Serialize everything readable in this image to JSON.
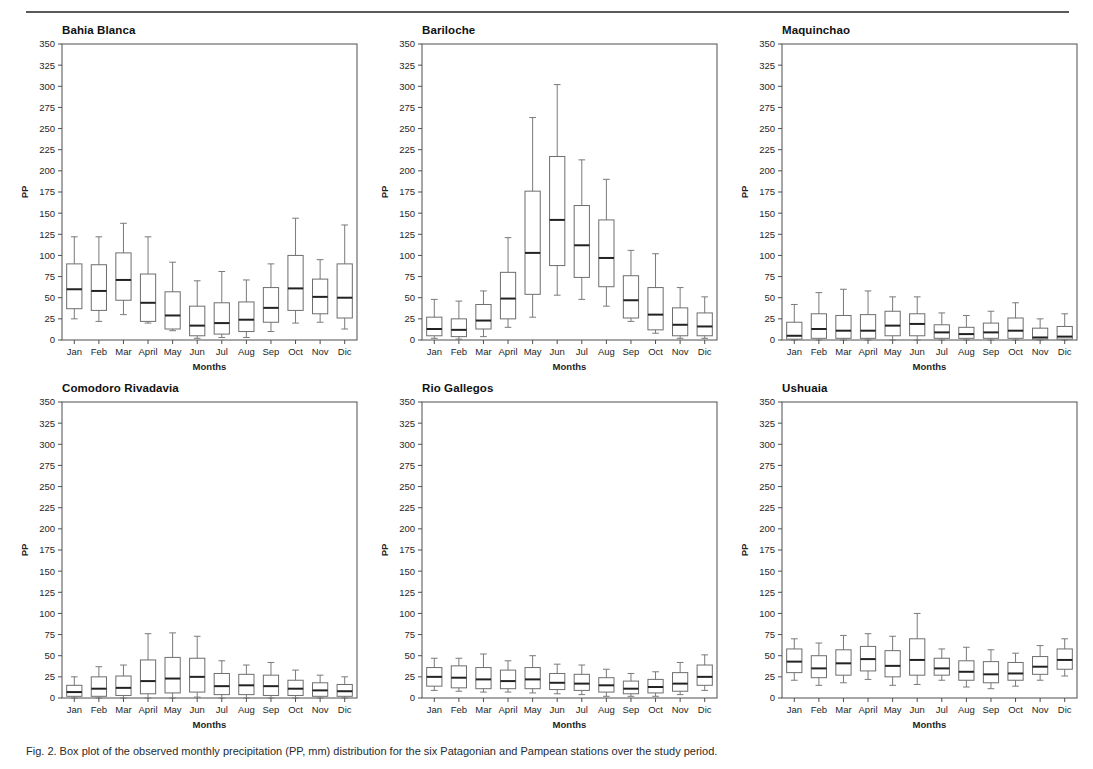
{
  "figure": {
    "caption": "Fig. 2. Box plot of the observed monthly precipitation (PP, mm) distribution for the six Patagonian and Pampean stations over the study period.",
    "axis_x_title": "Months",
    "axis_y_title": "PP",
    "months": [
      "Jan",
      "Feb",
      "Mar",
      "April",
      "May",
      "Jun",
      "Jul",
      "Aug",
      "Sep",
      "Oct",
      "Nov",
      "Dic"
    ],
    "y_ticks": [
      0,
      25,
      50,
      75,
      100,
      125,
      150,
      175,
      200,
      225,
      250,
      275,
      300,
      325,
      350
    ],
    "colors": {
      "axis": "#4f4f4f",
      "box": "#6e6e6e",
      "median": "#222222",
      "whisker": "#7a7a7a",
      "rule": "#5a5a5a",
      "background": "#ffffff"
    }
  },
  "chart_data": [
    {
      "type": "box",
      "title": "Bahia Blanca",
      "xlabel": "Months",
      "ylabel": "PP",
      "ylim": [
        0,
        350
      ],
      "categories": [
        "Jan",
        "Feb",
        "Mar",
        "April",
        "May",
        "Jun",
        "Jul",
        "Aug",
        "Sep",
        "Oct",
        "Nov",
        "Dic"
      ],
      "boxes": [
        {
          "category": "Jan",
          "min": 25,
          "q1": 37,
          "median": 60,
          "q3": 90,
          "max": 122
        },
        {
          "category": "Feb",
          "min": 22,
          "q1": 35,
          "median": 58,
          "q3": 89,
          "max": 122
        },
        {
          "category": "Mar",
          "min": 30,
          "q1": 47,
          "median": 71,
          "q3": 103,
          "max": 138
        },
        {
          "category": "April",
          "min": 20,
          "q1": 22,
          "median": 44,
          "q3": 78,
          "max": 122
        },
        {
          "category": "May",
          "min": 11,
          "q1": 13,
          "median": 29,
          "q3": 57,
          "max": 92
        },
        {
          "category": "Jun",
          "min": 2,
          "q1": 5,
          "median": 17,
          "q3": 40,
          "max": 70
        },
        {
          "category": "Jul",
          "min": 3,
          "q1": 7,
          "median": 20,
          "q3": 44,
          "max": 81
        },
        {
          "category": "Aug",
          "min": 3,
          "q1": 10,
          "median": 24,
          "q3": 45,
          "max": 71
        },
        {
          "category": "Sep",
          "min": 10,
          "q1": 21,
          "median": 38,
          "q3": 62,
          "max": 90
        },
        {
          "category": "Oct",
          "min": 20,
          "q1": 35,
          "median": 61,
          "q3": 100,
          "max": 144
        },
        {
          "category": "Nov",
          "min": 21,
          "q1": 31,
          "median": 51,
          "q3": 72,
          "max": 95
        },
        {
          "category": "Dic",
          "min": 13,
          "q1": 26,
          "median": 50,
          "q3": 90,
          "max": 136
        }
      ]
    },
    {
      "type": "box",
      "title": "Bariloche",
      "xlabel": "Months",
      "ylabel": "PP",
      "ylim": [
        0,
        350
      ],
      "categories": [
        "Jan",
        "Feb",
        "Mar",
        "April",
        "May",
        "Jun",
        "Jul",
        "Aug",
        "Sep",
        "Oct",
        "Nov",
        "Dic"
      ],
      "boxes": [
        {
          "category": "Jan",
          "min": 2,
          "q1": 5,
          "median": 13,
          "q3": 27,
          "max": 48
        },
        {
          "category": "Feb",
          "min": 1,
          "q1": 4,
          "median": 12,
          "q3": 25,
          "max": 46
        },
        {
          "category": "Mar",
          "min": 4,
          "q1": 13,
          "median": 23,
          "q3": 42,
          "max": 58
        },
        {
          "category": "April",
          "min": 15,
          "q1": 25,
          "median": 49,
          "q3": 80,
          "max": 121
        },
        {
          "category": "May",
          "min": 27,
          "q1": 54,
          "median": 103,
          "q3": 176,
          "max": 263
        },
        {
          "category": "Jun",
          "min": 53,
          "q1": 88,
          "median": 142,
          "q3": 217,
          "max": 302
        },
        {
          "category": "Jul",
          "min": 48,
          "q1": 74,
          "median": 112,
          "q3": 159,
          "max": 213
        },
        {
          "category": "Aug",
          "min": 40,
          "q1": 63,
          "median": 97,
          "q3": 142,
          "max": 190
        },
        {
          "category": "Sep",
          "min": 22,
          "q1": 26,
          "median": 47,
          "q3": 76,
          "max": 106
        },
        {
          "category": "Oct",
          "min": 8,
          "q1": 12,
          "median": 30,
          "q3": 62,
          "max": 102
        },
        {
          "category": "Nov",
          "min": 2,
          "q1": 5,
          "median": 18,
          "q3": 38,
          "max": 62
        },
        {
          "category": "Dic",
          "min": 2,
          "q1": 5,
          "median": 16,
          "q3": 32,
          "max": 51
        }
      ]
    },
    {
      "type": "box",
      "title": "Maquinchao",
      "xlabel": "Months",
      "ylabel": "PP",
      "ylim": [
        0,
        350
      ],
      "categories": [
        "Jan",
        "Feb",
        "Mar",
        "April",
        "May",
        "Jun",
        "Jul",
        "Aug",
        "Sep",
        "Oct",
        "Nov",
        "Dic"
      ],
      "boxes": [
        {
          "category": "Jan",
          "min": 0,
          "q1": 1,
          "median": 5,
          "q3": 21,
          "max": 42
        },
        {
          "category": "Feb",
          "min": 0,
          "q1": 2,
          "median": 13,
          "q3": 31,
          "max": 56
        },
        {
          "category": "Mar",
          "min": 0,
          "q1": 2,
          "median": 11,
          "q3": 29,
          "max": 60
        },
        {
          "category": "April",
          "min": 0,
          "q1": 2,
          "median": 11,
          "q3": 30,
          "max": 58
        },
        {
          "category": "May",
          "min": 0,
          "q1": 5,
          "median": 17,
          "q3": 34,
          "max": 51
        },
        {
          "category": "Jun",
          "min": 0,
          "q1": 5,
          "median": 19,
          "q3": 31,
          "max": 51
        },
        {
          "category": "Jul",
          "min": 0,
          "q1": 2,
          "median": 9,
          "q3": 18,
          "max": 32
        },
        {
          "category": "Aug",
          "min": 0,
          "q1": 2,
          "median": 7,
          "q3": 15,
          "max": 29
        },
        {
          "category": "Sep",
          "min": 0,
          "q1": 2,
          "median": 9,
          "q3": 20,
          "max": 34
        },
        {
          "category": "Oct",
          "min": 0,
          "q1": 2,
          "median": 11,
          "q3": 26,
          "max": 44
        },
        {
          "category": "Nov",
          "min": 0,
          "q1": 1,
          "median": 3,
          "q3": 14,
          "max": 25
        },
        {
          "category": "Dic",
          "min": 0,
          "q1": 1,
          "median": 4,
          "q3": 16,
          "max": 31
        }
      ]
    },
    {
      "type": "box",
      "title": "Comodoro Rivadavia",
      "xlabel": "Months",
      "ylabel": "PP",
      "ylim": [
        0,
        350
      ],
      "categories": [
        "Jan",
        "Feb",
        "Mar",
        "April",
        "May",
        "Jun",
        "Jul",
        "Aug",
        "Sep",
        "Oct",
        "Nov",
        "Dic"
      ],
      "boxes": [
        {
          "category": "Jan",
          "min": 0,
          "q1": 2,
          "median": 7,
          "q3": 15,
          "max": 25
        },
        {
          "category": "Feb",
          "min": 0,
          "q1": 2,
          "median": 11,
          "q3": 25,
          "max": 37
        },
        {
          "category": "Mar",
          "min": 0,
          "q1": 3,
          "median": 12,
          "q3": 26,
          "max": 39
        },
        {
          "category": "April",
          "min": 0,
          "q1": 5,
          "median": 20,
          "q3": 45,
          "max": 76
        },
        {
          "category": "May",
          "min": 0,
          "q1": 6,
          "median": 23,
          "q3": 48,
          "max": 77
        },
        {
          "category": "Jun",
          "min": 1,
          "q1": 7,
          "median": 25,
          "q3": 47,
          "max": 73
        },
        {
          "category": "Jul",
          "min": 0,
          "q1": 4,
          "median": 14,
          "q3": 29,
          "max": 44
        },
        {
          "category": "Aug",
          "min": 0,
          "q1": 4,
          "median": 15,
          "q3": 28,
          "max": 39
        },
        {
          "category": "Sep",
          "min": 0,
          "q1": 3,
          "median": 14,
          "q3": 27,
          "max": 42
        },
        {
          "category": "Oct",
          "min": 0,
          "q1": 3,
          "median": 11,
          "q3": 21,
          "max": 33
        },
        {
          "category": "Nov",
          "min": 0,
          "q1": 2,
          "median": 9,
          "q3": 18,
          "max": 27
        },
        {
          "category": "Dic",
          "min": 0,
          "q1": 2,
          "median": 8,
          "q3": 16,
          "max": 25
        }
      ]
    },
    {
      "type": "box",
      "title": "Rio Gallegos",
      "xlabel": "Months",
      "ylabel": "PP",
      "ylim": [
        0,
        350
      ],
      "categories": [
        "Jan",
        "Feb",
        "Mar",
        "April",
        "May",
        "Jun",
        "Jul",
        "Aug",
        "Sep",
        "Oct",
        "Nov",
        "Dic"
      ],
      "boxes": [
        {
          "category": "Jan",
          "min": 9,
          "q1": 14,
          "median": 25,
          "q3": 36,
          "max": 47
        },
        {
          "category": "Feb",
          "min": 8,
          "q1": 12,
          "median": 24,
          "q3": 38,
          "max": 47
        },
        {
          "category": "Mar",
          "min": 7,
          "q1": 11,
          "median": 22,
          "q3": 36,
          "max": 52
        },
        {
          "category": "April",
          "min": 7,
          "q1": 11,
          "median": 20,
          "q3": 33,
          "max": 44
        },
        {
          "category": "May",
          "min": 6,
          "q1": 11,
          "median": 22,
          "q3": 36,
          "max": 50
        },
        {
          "category": "Jun",
          "min": 5,
          "q1": 10,
          "median": 18,
          "q3": 29,
          "max": 40
        },
        {
          "category": "Jul",
          "min": 4,
          "q1": 9,
          "median": 17,
          "q3": 28,
          "max": 39
        },
        {
          "category": "Aug",
          "min": 2,
          "q1": 7,
          "median": 15,
          "q3": 24,
          "max": 34
        },
        {
          "category": "Sep",
          "min": 2,
          "q1": 5,
          "median": 11,
          "q3": 20,
          "max": 29
        },
        {
          "category": "Oct",
          "min": 2,
          "q1": 6,
          "median": 13,
          "q3": 22,
          "max": 31
        },
        {
          "category": "Nov",
          "min": 4,
          "q1": 8,
          "median": 17,
          "q3": 30,
          "max": 42
        },
        {
          "category": "Dic",
          "min": 9,
          "q1": 15,
          "median": 25,
          "q3": 39,
          "max": 51
        }
      ]
    },
    {
      "type": "box",
      "title": "Ushuaia",
      "xlabel": "Months",
      "ylabel": "PP",
      "ylim": [
        0,
        350
      ],
      "categories": [
        "Jan",
        "Feb",
        "Mar",
        "April",
        "May",
        "Jun",
        "Jul",
        "Aug",
        "Sep",
        "Oct",
        "Nov",
        "Dic"
      ],
      "boxes": [
        {
          "category": "Jan",
          "min": 21,
          "q1": 30,
          "median": 43,
          "q3": 58,
          "max": 70
        },
        {
          "category": "Feb",
          "min": 15,
          "q1": 24,
          "median": 35,
          "q3": 50,
          "max": 65
        },
        {
          "category": "Mar",
          "min": 18,
          "q1": 27,
          "median": 41,
          "q3": 57,
          "max": 74
        },
        {
          "category": "April",
          "min": 22,
          "q1": 32,
          "median": 46,
          "q3": 61,
          "max": 76
        },
        {
          "category": "May",
          "min": 15,
          "q1": 25,
          "median": 38,
          "q3": 56,
          "max": 73
        },
        {
          "category": "Jun",
          "min": 16,
          "q1": 27,
          "median": 45,
          "q3": 70,
          "max": 100
        },
        {
          "category": "Jul",
          "min": 21,
          "q1": 27,
          "median": 35,
          "q3": 47,
          "max": 58
        },
        {
          "category": "Aug",
          "min": 13,
          "q1": 21,
          "median": 31,
          "q3": 44,
          "max": 60
        },
        {
          "category": "Sep",
          "min": 11,
          "q1": 18,
          "median": 28,
          "q3": 43,
          "max": 57
        },
        {
          "category": "Oct",
          "min": 14,
          "q1": 21,
          "median": 29,
          "q3": 42,
          "max": 53
        },
        {
          "category": "Nov",
          "min": 21,
          "q1": 28,
          "median": 37,
          "q3": 49,
          "max": 62
        },
        {
          "category": "Dic",
          "min": 26,
          "q1": 34,
          "median": 45,
          "q3": 58,
          "max": 70
        }
      ]
    }
  ]
}
